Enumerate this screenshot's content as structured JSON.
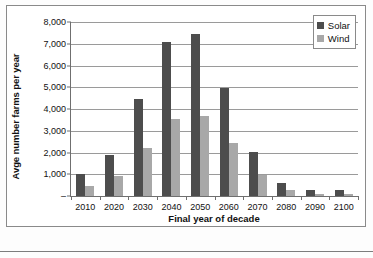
{
  "chart_data": {
    "type": "bar",
    "title": "",
    "xlabel": "Final year of decade",
    "ylabel": "Avge number farms per year",
    "categories": [
      "2010",
      "2020",
      "2030",
      "2040",
      "2050",
      "2060",
      "2070",
      "2080",
      "2090",
      "2100"
    ],
    "series": [
      {
        "name": "Solar",
        "color": "#4d4d4d",
        "values": [
          1000,
          1900,
          4480,
          7100,
          7450,
          4950,
          2020,
          620,
          290,
          280
        ]
      },
      {
        "name": "Wind",
        "color": "#a8a8a8",
        "values": [
          450,
          940,
          2220,
          3520,
          3700,
          2430,
          960,
          280,
          110,
          100
        ]
      }
    ],
    "ylim": [
      0,
      8000
    ],
    "yticks": [
      "–",
      "1,000",
      "2,000",
      "3,000",
      "4,000",
      "5,000",
      "6,000",
      "7,000",
      "8,000"
    ],
    "ytick_values": [
      0,
      1000,
      2000,
      3000,
      4000,
      5000,
      6000,
      7000,
      8000
    ],
    "grid": true,
    "legend_position": "top-right"
  },
  "legend": {
    "items": [
      {
        "label": "Solar",
        "swatch": "solar-swatch-icon"
      },
      {
        "label": "Wind",
        "swatch": "wind-swatch-icon"
      }
    ]
  }
}
